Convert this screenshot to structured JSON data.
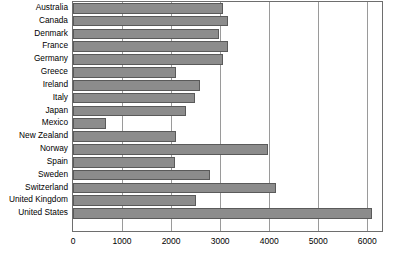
{
  "chart_data": {
    "type": "bar",
    "orientation": "horizontal",
    "title": "",
    "xlabel": "",
    "ylabel": "",
    "xlim": [
      0,
      6300
    ],
    "grid": true,
    "legend": null,
    "xticks": [
      0,
      1000,
      2000,
      3000,
      4000,
      5000,
      6000
    ],
    "xtick_labels": [
      "0",
      "1000",
      "2000",
      "3000",
      "4000",
      "5000",
      "6000"
    ],
    "categories": [
      "Australia",
      "Canada",
      "Denmark",
      "France",
      "Germany",
      "Greece",
      "Ireland",
      "Italy",
      "Japan",
      "Mexico",
      "New Zealand",
      "Norway",
      "Spain",
      "Sweden",
      "Switzerland",
      "United Kingdom",
      "United States"
    ],
    "values": [
      3050,
      3160,
      2980,
      3150,
      3050,
      2100,
      2580,
      2490,
      2300,
      680,
      2100,
      3980,
      2080,
      2800,
      4130,
      2500,
      6100
    ],
    "bar_color": "#8c8c8c",
    "bar_edge_color": "#5a5a5a",
    "gridline_color": "#9a9a9a",
    "frame_color": "#6e6e6e",
    "background_color": "#ffffff"
  }
}
